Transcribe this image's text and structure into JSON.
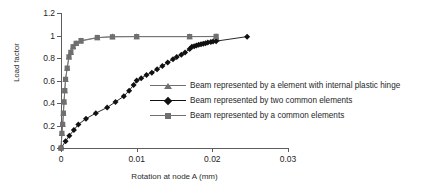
{
  "chart_data": {
    "type": "line",
    "title": "",
    "xlabel": "Rotation at node A (mm)",
    "ylabel": "Load factor",
    "xlim": [
      0,
      0.03
    ],
    "ylim": [
      0,
      1.2
    ],
    "xticks": [
      "0",
      "0.01",
      "0.02",
      "0.03"
    ],
    "xtickvals": [
      0,
      0.01,
      0.02,
      0.03
    ],
    "yticks": [
      "0",
      "0.2",
      "0.4",
      "0.6",
      "0.8",
      "1",
      "1.2"
    ],
    "ytickvals": [
      0,
      0.2,
      0.4,
      0.6,
      0.8,
      1,
      1.2
    ],
    "grid": false,
    "legend_position": "center-right",
    "series": [
      {
        "name": "Beam represented by a element with internal plastic hinge",
        "marker": "triangle",
        "color": "#6f6f6f",
        "points": [
          [
            0.0,
            0.0
          ],
          [
            0.00012,
            0.13
          ],
          [
            0.00022,
            0.21
          ],
          [
            0.00032,
            0.31
          ],
          [
            0.0004,
            0.41
          ],
          [
            0.0005,
            0.51
          ],
          [
            0.0006,
            0.61
          ],
          [
            0.00082,
            0.71
          ],
          [
            0.00105,
            0.81
          ],
          [
            0.0013,
            0.85
          ],
          [
            0.0016,
            0.9
          ],
          [
            0.002,
            0.93
          ],
          [
            0.0026,
            0.95
          ],
          [
            0.0048,
            0.98
          ],
          [
            0.0068,
            0.99
          ],
          [
            0.01,
            0.99
          ],
          [
            0.017,
            0.99
          ],
          [
            0.0205,
            0.99
          ],
          [
            0.0206,
            0.97
          ]
        ]
      },
      {
        "name": "Beam represented by two common elements",
        "marker": "diamond",
        "color": "#111111",
        "points": [
          [
            0.0,
            0.0
          ],
          [
            0.0006,
            0.06
          ],
          [
            0.0011,
            0.11
          ],
          [
            0.0017,
            0.16
          ],
          [
            0.0023,
            0.21
          ],
          [
            0.0033,
            0.26
          ],
          [
            0.0046,
            0.31
          ],
          [
            0.0061,
            0.36
          ],
          [
            0.0072,
            0.41
          ],
          [
            0.0083,
            0.46
          ],
          [
            0.009,
            0.51
          ],
          [
            0.0096,
            0.56
          ],
          [
            0.01,
            0.6
          ],
          [
            0.0106,
            0.62
          ],
          [
            0.0113,
            0.65
          ],
          [
            0.012,
            0.67
          ],
          [
            0.0127,
            0.7
          ],
          [
            0.0134,
            0.73
          ],
          [
            0.0141,
            0.76
          ],
          [
            0.0148,
            0.79
          ],
          [
            0.0153,
            0.81
          ],
          [
            0.0159,
            0.83
          ],
          [
            0.0164,
            0.85
          ],
          [
            0.017,
            0.88
          ],
          [
            0.0173,
            0.9
          ],
          [
            0.0176,
            0.905
          ],
          [
            0.0179,
            0.911
          ],
          [
            0.0182,
            0.917
          ],
          [
            0.0185,
            0.922
          ],
          [
            0.0188,
            0.927
          ],
          [
            0.0191,
            0.932
          ],
          [
            0.0194,
            0.937
          ],
          [
            0.0198,
            0.942
          ],
          [
            0.0201,
            0.946
          ],
          [
            0.0205,
            0.95
          ],
          [
            0.0246,
            0.99
          ]
        ]
      },
      {
        "name": "Beam represented by a common elements",
        "marker": "square",
        "color": "#6f6f6f",
        "points": [
          [
            0.0,
            0.0
          ],
          [
            0.00012,
            0.13
          ],
          [
            0.00022,
            0.21
          ],
          [
            0.00032,
            0.31
          ],
          [
            0.0004,
            0.41
          ],
          [
            0.0005,
            0.51
          ],
          [
            0.0006,
            0.61
          ],
          [
            0.00082,
            0.71
          ],
          [
            0.00105,
            0.81
          ],
          [
            0.0013,
            0.85
          ],
          [
            0.0016,
            0.9
          ],
          [
            0.002,
            0.93
          ],
          [
            0.00265,
            0.955
          ],
          [
            0.0048,
            0.982
          ],
          [
            0.0068,
            0.988
          ],
          [
            0.01,
            0.99
          ],
          [
            0.017,
            0.99
          ],
          [
            0.0205,
            0.992
          ]
        ]
      }
    ]
  },
  "legend": {
    "items": [
      {
        "label": "Beam represented by a element with internal plastic hinge",
        "marker": "triangle",
        "color": "#6f6f6f"
      },
      {
        "label": "Beam represented by two common elements",
        "marker": "diamond",
        "color": "#111111"
      },
      {
        "label": "Beam represented by a common elements",
        "marker": "square",
        "color": "#6f6f6f"
      }
    ]
  }
}
